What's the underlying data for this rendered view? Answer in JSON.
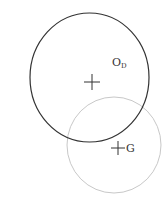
{
  "diagram": {
    "shapes": [
      {
        "id": "circle-d",
        "kind": "circle",
        "color": "#333333",
        "center_label": "O",
        "center_label_sub": "D"
      },
      {
        "id": "circle-g",
        "kind": "circle",
        "color": "#bfbfbf",
        "center_label": "G"
      }
    ],
    "markers": [
      {
        "id": "center-d",
        "symbol": "plus",
        "color": "#333333"
      },
      {
        "id": "center-g",
        "symbol": "plus",
        "color": "#333333"
      }
    ],
    "labels": {
      "od_main": "O",
      "od_sub": "D",
      "g": "G"
    }
  }
}
